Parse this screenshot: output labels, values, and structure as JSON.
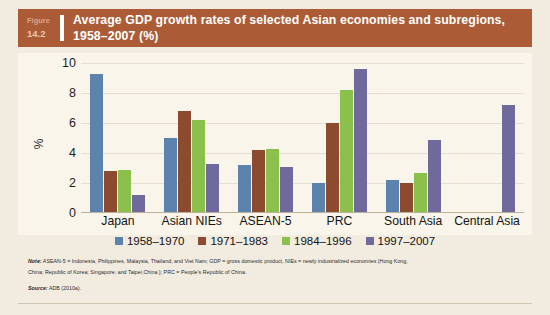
{
  "figure": {
    "label": "Figure",
    "number": "14.2",
    "title": "Average GDP growth rates of selected Asian economies and subregions, 1958–2007 (%)"
  },
  "notes": {
    "note_lead": "Note:",
    "note_line1": " ASEAN-5 = Indonesia, Philippines, Malaysia, Thailand, and Viet Nam; GDP = gross domestic product, NIEs = newly industrialized economies (Hong Kong,",
    "note_line2": "China; Republic of Korea; Singapore; and Taipei,China ); PRC = People's Republic of China.",
    "source_lead": "Source:",
    "source_text": " ADB (2010a)."
  },
  "chart_data": {
    "type": "bar",
    "title": "Average GDP growth rates of selected Asian economies and subregions, 1958–2007 (%)",
    "xlabel": "",
    "ylabel": "%",
    "ylim": [
      0,
      10
    ],
    "yticks": [
      0,
      2,
      4,
      6,
      8,
      10
    ],
    "grid": true,
    "legend_position": "bottom",
    "categories": [
      "Japan",
      "Asian NIEs",
      "ASEAN-5",
      "PRC",
      "South Asia",
      "Central Asia"
    ],
    "series": [
      {
        "name": "1958–1970",
        "color": "#5b83ad",
        "values": [
          9.3,
          5.0,
          3.2,
          2.0,
          2.2,
          null
        ]
      },
      {
        "name": "1971–1983",
        "color": "#8c4a2f",
        "values": [
          2.8,
          6.8,
          4.2,
          6.0,
          2.0,
          null
        ]
      },
      {
        "name": "1984–1996",
        "color": "#8cc04c",
        "values": [
          2.9,
          6.2,
          4.3,
          8.2,
          2.7,
          null
        ]
      },
      {
        "name": "1997–2007",
        "color": "#6f6a9b",
        "values": [
          1.2,
          3.3,
          3.1,
          9.6,
          4.9,
          7.2
        ]
      }
    ]
  },
  "colors": {
    "header_bar": "#ab5c36",
    "page_background": "#f2ece0",
    "plot_background": "#faf5ea"
  }
}
